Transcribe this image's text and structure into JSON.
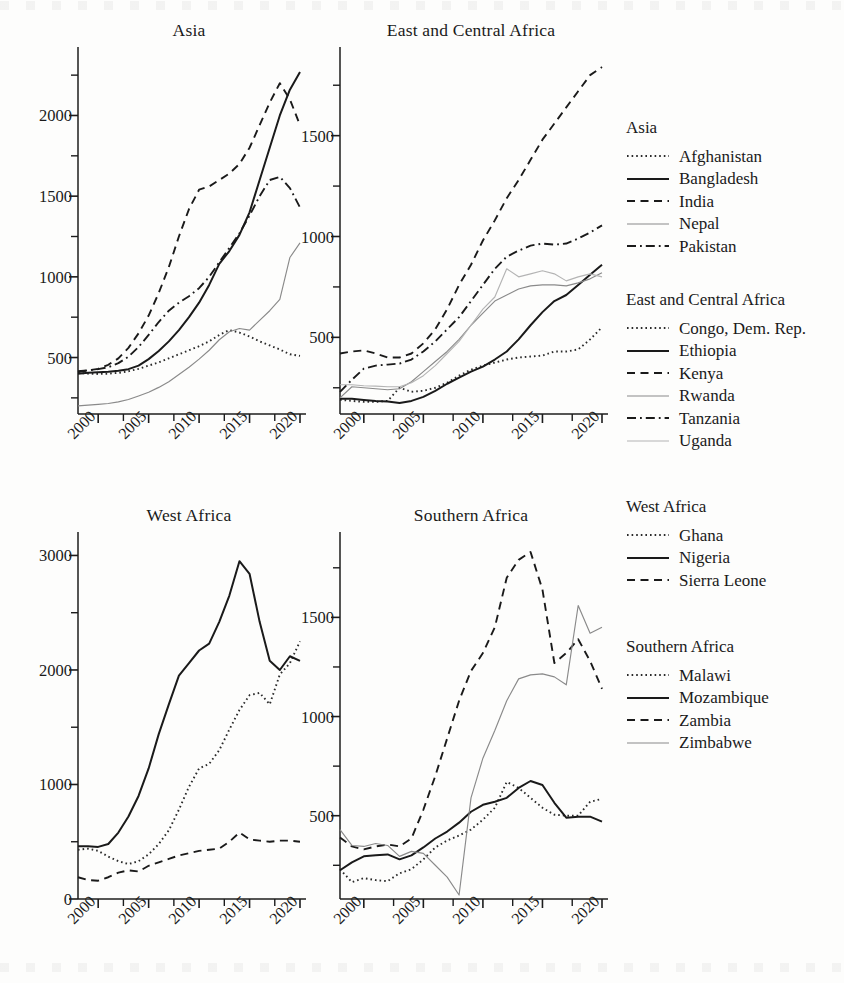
{
  "figure": {
    "top_artifact": "",
    "bottom_artifact": ""
  },
  "panels": [
    {
      "id": "asia",
      "title": "Asia"
    },
    {
      "id": "eca",
      "title": "East and Central Africa"
    },
    {
      "id": "west",
      "title": "West Africa"
    },
    {
      "id": "south",
      "title": "Southern Africa"
    }
  ],
  "legend": {
    "groups": [
      {
        "title": "Asia",
        "items": [
          {
            "label": "Afghanistan",
            "style": "dotted",
            "color": "#2a2a2a"
          },
          {
            "label": "Bangladesh",
            "style": "solid",
            "color": "#1a1a1a"
          },
          {
            "label": "India",
            "style": "dashed",
            "color": "#1a1a1a"
          },
          {
            "label": "Nepal",
            "style": "solid-thin",
            "color": "#8a8a8a"
          },
          {
            "label": "Pakistan",
            "style": "dashdot",
            "color": "#1a1a1a"
          }
        ]
      },
      {
        "title": "East and Central Africa",
        "items": [
          {
            "label": "Congo, Dem. Rep.",
            "style": "dotted",
            "color": "#2a2a2a"
          },
          {
            "label": "Ethiopia",
            "style": "solid",
            "color": "#1a1a1a"
          },
          {
            "label": "Kenya",
            "style": "dashed",
            "color": "#1a1a1a"
          },
          {
            "label": "Rwanda",
            "style": "solid-thin",
            "color": "#8a8a8a"
          },
          {
            "label": "Tanzania",
            "style": "dashdot",
            "color": "#1a1a1a"
          },
          {
            "label": "Uganda",
            "style": "solid-thin",
            "color": "#b4b4b4"
          }
        ]
      },
      {
        "title": "West Africa",
        "items": [
          {
            "label": "Ghana",
            "style": "dotted",
            "color": "#2a2a2a"
          },
          {
            "label": "Nigeria",
            "style": "solid",
            "color": "#1a1a1a"
          },
          {
            "label": "Sierra Leone",
            "style": "dashed",
            "color": "#1a1a1a"
          }
        ]
      },
      {
        "title": "Southern Africa",
        "items": [
          {
            "label": "Malawi",
            "style": "dotted",
            "color": "#2a2a2a"
          },
          {
            "label": "Mozambique",
            "style": "solid",
            "color": "#1a1a1a"
          },
          {
            "label": "Zambia",
            "style": "dashed",
            "color": "#1a1a1a"
          },
          {
            "label": "Zimbabwe",
            "style": "solid-thin",
            "color": "#8a8a8a"
          }
        ]
      }
    ]
  },
  "chart_data": [
    {
      "type": "line",
      "title": "Asia",
      "xlabel": "",
      "ylabel": "",
      "xlim": [
        1998,
        2020
      ],
      "ylim": [
        150,
        2350
      ],
      "xticks": [
        2000,
        2005,
        2010,
        2015,
        2020
      ],
      "xtick_labels": [
        "2000",
        "2005",
        "2010",
        "2015",
        "2020"
      ],
      "xminor_step": 2.5,
      "yticks": [
        500,
        1000,
        1500,
        2000
      ],
      "ytick_labels": [
        "500",
        "1000",
        "1500",
        "2000"
      ],
      "yminor_step": 250,
      "grid": false,
      "legend_position": "right-outside",
      "x": [
        1998,
        1999,
        2000,
        2001,
        2002,
        2003,
        2004,
        2005,
        2006,
        2007,
        2008,
        2009,
        2010,
        2011,
        2012,
        2013,
        2014,
        2015,
        2016,
        2017,
        2018,
        2019,
        2020
      ],
      "series": [
        {
          "name": "Afghanistan",
          "style": "dotted",
          "values": [
            405,
            400,
            398,
            400,
            405,
            415,
            430,
            450,
            470,
            495,
            520,
            545,
            570,
            600,
            640,
            670,
            655,
            630,
            600,
            575,
            550,
            520,
            510
          ]
        },
        {
          "name": "Bangladesh",
          "style": "solid",
          "values": [
            400,
            405,
            408,
            412,
            418,
            428,
            450,
            490,
            540,
            600,
            670,
            750,
            840,
            950,
            1080,
            1160,
            1260,
            1400,
            1600,
            1800,
            2000,
            2160,
            2270
          ]
        },
        {
          "name": "India",
          "style": "dashed",
          "values": [
            410,
            420,
            430,
            455,
            495,
            560,
            650,
            760,
            900,
            1060,
            1250,
            1420,
            1540,
            1560,
            1600,
            1640,
            1700,
            1800,
            1940,
            2080,
            2200,
            2100,
            1940
          ]
        },
        {
          "name": "Nepal",
          "style": "solid-thin",
          "values": [
            200,
            205,
            210,
            215,
            225,
            240,
            262,
            285,
            315,
            350,
            395,
            440,
            490,
            545,
            610,
            660,
            680,
            670,
            730,
            790,
            860,
            1120,
            1210
          ]
        },
        {
          "name": "Pakistan",
          "style": "dashdot",
          "values": [
            415,
            420,
            428,
            440,
            465,
            505,
            565,
            640,
            720,
            790,
            840,
            880,
            930,
            1000,
            1090,
            1180,
            1270,
            1380,
            1500,
            1600,
            1620,
            1550,
            1430
          ]
        }
      ]
    },
    {
      "type": "line",
      "title": "East and Central Africa",
      "xlabel": "",
      "ylabel": "",
      "xlim": [
        1998,
        2020
      ],
      "ylim": [
        120,
        1880
      ],
      "xticks": [
        2000,
        2005,
        2010,
        2015,
        2020
      ],
      "xtick_labels": [
        "2000",
        "2005",
        "2010",
        "2015",
        "2020"
      ],
      "xminor_step": 2.5,
      "yticks": [
        500,
        1000,
        1500
      ],
      "ytick_labels": [
        "500",
        "1000",
        "1500"
      ],
      "yminor_step": 250,
      "grid": false,
      "legend_position": "right-outside",
      "x": [
        1998,
        1999,
        2000,
        2001,
        2002,
        2003,
        2004,
        2005,
        2006,
        2007,
        2008,
        2009,
        2010,
        2011,
        2012,
        2013,
        2014,
        2015,
        2016,
        2017,
        2018,
        2019,
        2020
      ],
      "series": [
        {
          "name": "Congo, Dem. Rep.",
          "style": "dotted",
          "values": [
            190,
            185,
            180,
            180,
            185,
            250,
            230,
            235,
            250,
            275,
            310,
            340,
            360,
            375,
            390,
            400,
            405,
            410,
            430,
            430,
            440,
            490,
            550
          ]
        },
        {
          "name": "Ethiopia",
          "style": "solid",
          "values": [
            195,
            195,
            190,
            185,
            182,
            175,
            185,
            205,
            235,
            270,
            300,
            330,
            355,
            390,
            430,
            490,
            560,
            625,
            680,
            710,
            760,
            810,
            860
          ]
        },
        {
          "name": "Kenya",
          "style": "dashed",
          "values": [
            420,
            430,
            435,
            420,
            400,
            400,
            420,
            470,
            540,
            640,
            760,
            860,
            980,
            1080,
            1190,
            1280,
            1380,
            1480,
            1560,
            1640,
            1720,
            1800,
            1840
          ]
        },
        {
          "name": "Rwanda",
          "style": "solid-thin",
          "values": [
            200,
            255,
            250,
            245,
            240,
            245,
            280,
            330,
            380,
            430,
            490,
            560,
            620,
            680,
            710,
            740,
            755,
            760,
            760,
            755,
            770,
            790,
            820
          ]
        },
        {
          "name": "Tanzania",
          "style": "dashdot",
          "values": [
            230,
            290,
            345,
            360,
            365,
            370,
            390,
            430,
            480,
            540,
            600,
            680,
            760,
            840,
            900,
            930,
            955,
            965,
            960,
            965,
            990,
            1020,
            1055
          ]
        },
        {
          "name": "Uganda",
          "style": "solid-thin",
          "values": [
            265,
            265,
            260,
            258,
            255,
            255,
            275,
            310,
            360,
            420,
            480,
            560,
            640,
            700,
            840,
            800,
            815,
            830,
            815,
            780,
            800,
            815,
            800
          ]
        }
      ]
    },
    {
      "type": "line",
      "title": "West Africa",
      "xlabel": "",
      "ylabel": "",
      "xlim": [
        1998,
        2020
      ],
      "ylim": [
        0,
        3100
      ],
      "xticks": [
        2000,
        2005,
        2010,
        2015,
        2020
      ],
      "xtick_labels": [
        "2000",
        "2005",
        "2010",
        "2015",
        "2020"
      ],
      "xminor_step": 2.5,
      "yticks": [
        0,
        1000,
        2000,
        3000
      ],
      "ytick_labels": [
        "0",
        "1000",
        "2000",
        "3000"
      ],
      "yminor_step": 500,
      "grid": false,
      "legend_position": "right-outside",
      "x": [
        1998,
        1999,
        2000,
        2001,
        2002,
        2003,
        2004,
        2005,
        2006,
        2007,
        2008,
        2009,
        2010,
        2011,
        2012,
        2013,
        2014,
        2015,
        2016,
        2017,
        2018,
        2019,
        2020
      ],
      "series": [
        {
          "name": "Ghana",
          "style": "dotted",
          "values": [
            430,
            440,
            420,
            370,
            330,
            305,
            330,
            390,
            480,
            600,
            780,
            980,
            1140,
            1180,
            1300,
            1480,
            1650,
            1780,
            1800,
            1700,
            1960,
            2060,
            2250
          ]
        },
        {
          "name": "Nigeria",
          "style": "solid",
          "values": [
            460,
            460,
            455,
            480,
            580,
            720,
            900,
            1140,
            1440,
            1700,
            1950,
            2060,
            2170,
            2230,
            2420,
            2650,
            2950,
            2840,
            2420,
            2080,
            2000,
            2120,
            2080
          ]
        },
        {
          "name": "Sierra Leone",
          "style": "dashed",
          "values": [
            190,
            165,
            160,
            190,
            230,
            250,
            240,
            290,
            320,
            350,
            380,
            400,
            420,
            430,
            440,
            500,
            580,
            520,
            510,
            500,
            510,
            510,
            500
          ]
        }
      ]
    },
    {
      "type": "line",
      "title": "Southern Africa",
      "xlabel": "",
      "ylabel": "",
      "xlim": [
        1998,
        2020
      ],
      "ylim": [
        80,
        1870
      ],
      "xticks": [
        2000,
        2005,
        2010,
        2015,
        2020
      ],
      "xtick_labels": [
        "2000",
        "2005",
        "2010",
        "2015",
        "2020"
      ],
      "xminor_step": 2.5,
      "yticks": [
        500,
        1000,
        1500
      ],
      "ytick_labels": [
        "500",
        "1000",
        "1500"
      ],
      "yminor_step": 250,
      "grid": false,
      "legend_position": "right-outside",
      "x": [
        1998,
        1999,
        2000,
        2001,
        2002,
        2003,
        2004,
        2005,
        2006,
        2007,
        2008,
        2009,
        2010,
        2011,
        2012,
        2013,
        2014,
        2015,
        2016,
        2017,
        2018,
        2019,
        2020
      ],
      "series": [
        {
          "name": "Malawi",
          "style": "dotted",
          "values": [
            230,
            165,
            185,
            175,
            170,
            210,
            230,
            280,
            340,
            375,
            400,
            430,
            480,
            540,
            670,
            640,
            590,
            540,
            505,
            500,
            500,
            570,
            585
          ]
        },
        {
          "name": "Mozambique",
          "style": "solid",
          "values": [
            225,
            265,
            295,
            300,
            305,
            280,
            300,
            340,
            385,
            420,
            465,
            520,
            555,
            570,
            590,
            640,
            675,
            655,
            565,
            490,
            495,
            495,
            470
          ]
        },
        {
          "name": "Zambia",
          "style": "dashed",
          "values": [
            390,
            345,
            330,
            345,
            355,
            345,
            385,
            530,
            700,
            890,
            1080,
            1230,
            1320,
            1450,
            1700,
            1790,
            1830,
            1640,
            1270,
            1320,
            1390,
            1280,
            1140
          ]
        },
        {
          "name": "Zimbabwe",
          "style": "solid-thin",
          "values": [
            430,
            350,
            345,
            360,
            350,
            295,
            320,
            310,
            250,
            190,
            100,
            590,
            790,
            930,
            1080,
            1190,
            1210,
            1215,
            1200,
            1160,
            1560,
            1420,
            1450
          ]
        }
      ]
    }
  ]
}
